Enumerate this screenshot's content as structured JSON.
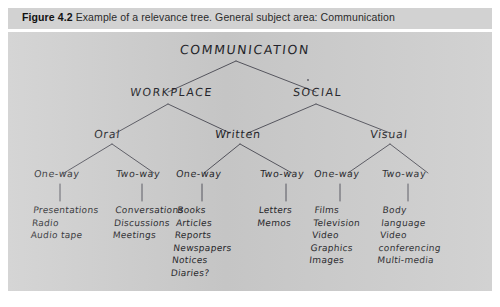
{
  "figure": {
    "number_label": "Figure 4.2",
    "caption": "Example of a relevance tree. General subject area: Communication"
  },
  "tree": {
    "root": {
      "label": "COMMUNICATION"
    },
    "level1": [
      {
        "label": "WORKPLACE"
      },
      {
        "label": "SOCIAL"
      }
    ],
    "level2": [
      {
        "label": "Oral"
      },
      {
        "label": "Written"
      },
      {
        "label": "Visual"
      }
    ],
    "level3": [
      {
        "label": "One-way"
      },
      {
        "label": "Two-way"
      },
      {
        "label": "One-way"
      },
      {
        "label": "Two-way"
      },
      {
        "label": "One-way"
      },
      {
        "label": "Two-way"
      }
    ],
    "leaves": [
      {
        "items": [
          "Presentations",
          "Radio",
          "Audio tape"
        ]
      },
      {
        "items": [
          "Conversations",
          "Discussions",
          "Meetings"
        ]
      },
      {
        "items": [
          "Books",
          "Articles",
          "Reports",
          "Newspapers",
          "Notices",
          "Diaries?"
        ]
      },
      {
        "items": [
          "Letters",
          "Memos"
        ]
      },
      {
        "items": [
          "Films",
          "Television",
          "Video",
          "Graphics",
          "Images"
        ]
      },
      {
        "items": [
          "Body",
          "language",
          "Video",
          "conferencing",
          "Multi-media"
        ]
      }
    ]
  },
  "colors": {
    "caption_bar": "#d2d2d2",
    "figure_background": "#cdcdcd",
    "ink": "#1f1f28",
    "line": "#55555e"
  }
}
